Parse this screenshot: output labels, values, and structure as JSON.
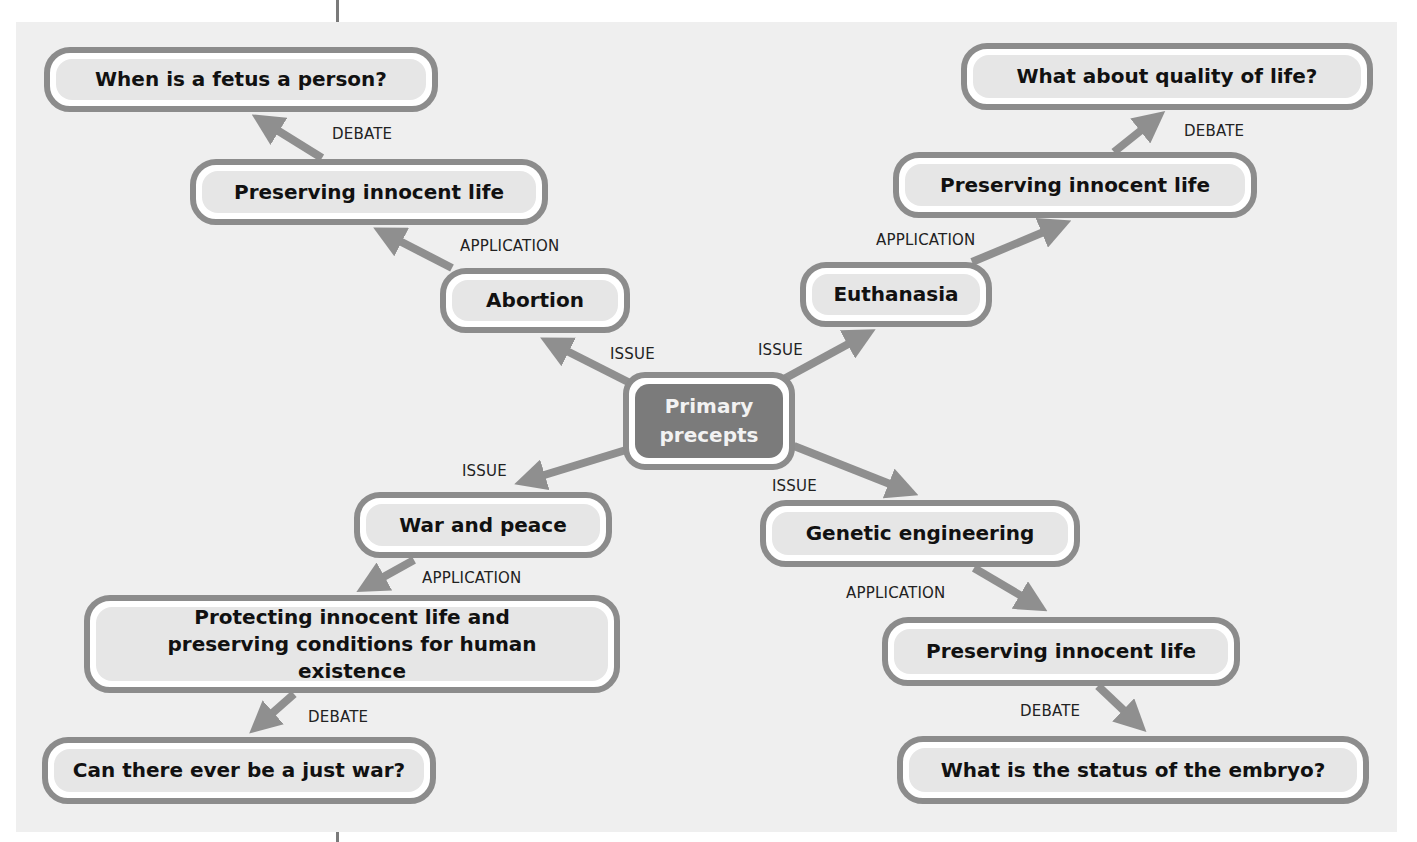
{
  "diagram": {
    "center": {
      "label": "Primary precepts"
    },
    "branches": [
      {
        "issue": "Abortion",
        "application": "Preserving innocent life",
        "debate": "When is a fetus a person?"
      },
      {
        "issue": "Euthanasia",
        "application": "Preserving innocent life",
        "debate": "What about quality of life?"
      },
      {
        "issue": "War and peace",
        "application": "Protecting innocent life and preserving conditions for human existence",
        "debate": "Can there ever be a just war?"
      },
      {
        "issue": "Genetic engineering",
        "application": "Preserving innocent life",
        "debate": "What is the status of the embryo?"
      }
    ],
    "edge_labels": {
      "issue": "ISSUE",
      "application": "APPLICATION",
      "debate": "DEBATE"
    },
    "colors": {
      "node_border": "#8c8c8c",
      "node_fill": "#e6e6e6",
      "center_fill": "#7b7b7b",
      "arrow": "#8f8f8f",
      "panel": "#efefef"
    }
  }
}
